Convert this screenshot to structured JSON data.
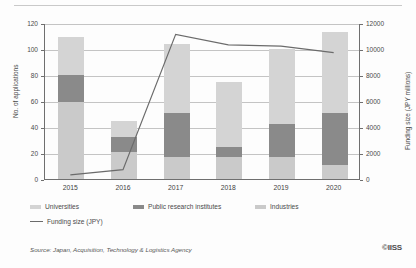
{
  "chart_data": {
    "type": "bar",
    "title": "",
    "categories": [
      "2015",
      "2016",
      "2017",
      "2018",
      "2019",
      "2020"
    ],
    "series": [
      {
        "name": "Universities",
        "color": "#d4d4d4",
        "values": [
          29,
          13,
          53,
          50,
          58,
          62
        ]
      },
      {
        "name": "Public research institutes",
        "color": "#8a8a8a",
        "values": [
          21,
          11,
          34,
          8,
          25,
          40
        ]
      },
      {
        "name": "Industries",
        "color": "#cacaca",
        "values": [
          59,
          21,
          17,
          17,
          17,
          11
        ]
      }
    ],
    "line_series": {
      "name": "Funding size (JPY)",
      "color": "#6b6b6b",
      "axis": "right",
      "values": [
        400,
        800,
        11200,
        10400,
        10300,
        9800
      ]
    },
    "xlabel": "",
    "ylabel_left": "No. of applications",
    "ylabel_right": "Funding size (JPY millions)",
    "ylim_left": [
      0,
      120
    ],
    "ylim_right": [
      0,
      12000
    ],
    "yticks_left": [
      "0",
      "20",
      "40",
      "60",
      "80",
      "100",
      "120"
    ],
    "yticks_right": [
      "0",
      "2000",
      "4000",
      "6000",
      "8000",
      "10000",
      "12000"
    ],
    "grid": true,
    "legend_position": "bottom"
  },
  "legend": {
    "items": [
      {
        "label": "Universities"
      },
      {
        "label": "Public research institutes"
      },
      {
        "label": "Industries"
      }
    ],
    "line_item": {
      "label": "Funding size (JPY)"
    }
  },
  "footer": {
    "source": "Source: Japan, Acquisition, Technology & Logistics Agency",
    "logo": "©IISS"
  }
}
